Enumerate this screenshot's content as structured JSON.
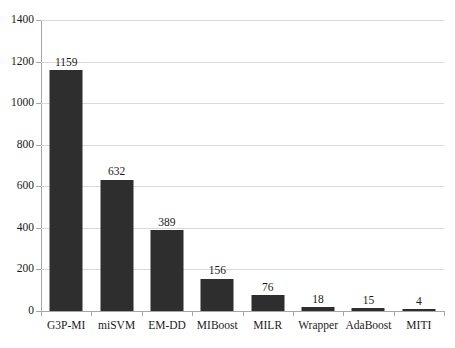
{
  "chart_data": {
    "type": "bar",
    "title": "",
    "subtitle": "",
    "xlabel": "",
    "ylabel": "",
    "categories": [
      "G3P-MI",
      "miSVM",
      "EM-DD",
      "MIBoost",
      "MILR",
      "Wrapper",
      "AdaBoost",
      "MITI"
    ],
    "values": [
      1159,
      632,
      389,
      156,
      76,
      18,
      15,
      4
    ],
    "value_labels": [
      "1159",
      "632",
      "389",
      "156",
      "76",
      "18",
      "15",
      "4"
    ],
    "ylim": [
      0,
      1400
    ],
    "ytick_values": [
      0,
      200,
      400,
      600,
      800,
      1000,
      1200,
      1400
    ],
    "ytick_labels": [
      "0",
      "200",
      "400",
      "600",
      "800",
      "1000",
      "1200",
      "1400"
    ],
    "grid": true,
    "grid_axis": "y",
    "legend": false,
    "legend_position": "none",
    "series": [
      {
        "name": "count",
        "values": [
          1159,
          632,
          389,
          156,
          76,
          18,
          15,
          4
        ]
      }
    ],
    "colors": {
      "bar": "#2e2e2e",
      "gridline": "#d9d9d9",
      "axis": "#a6a6a6",
      "text": "#1a1a1a",
      "background": "#ffffff"
    }
  }
}
